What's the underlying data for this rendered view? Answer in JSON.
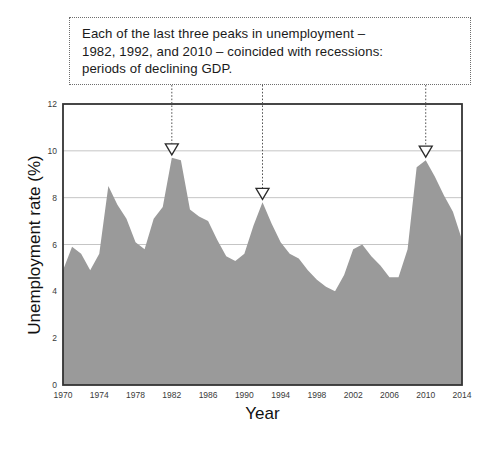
{
  "annotation": {
    "line1": "Each of the last three peaks in unemployment –",
    "line2": "1982, 1992, and 2010 – coincided with recessions:",
    "line3": "periods of declining GDP."
  },
  "caption": "",
  "colors": {
    "area_fill": "#9a9a9a",
    "axis": "#333333",
    "gridline": "#b6b6b6",
    "annotation_border": "#6e6e6e",
    "marker_stroke": "#2b2b2b",
    "dropline": "#555555",
    "text": "#1a1a1a"
  },
  "chart_data": {
    "type": "area",
    "title": "",
    "subtitle": "",
    "xlabel": "Year",
    "ylabel": "Unemployment rate (%)",
    "xlim": [
      1970,
      2014
    ],
    "ylim": [
      0,
      12
    ],
    "xticks": [
      1970,
      1974,
      1978,
      1982,
      1986,
      1990,
      1994,
      1998,
      2002,
      2006,
      2010,
      2014
    ],
    "yticks": [
      0,
      2,
      4,
      6,
      8,
      10,
      12
    ],
    "xtick_labels": [
      "1970",
      "1974",
      "1978",
      "1982",
      "1986",
      "1990",
      "1994",
      "1998",
      "2002",
      "2006",
      "2010",
      "2014"
    ],
    "ytick_labels": [
      "0",
      "2",
      "4",
      "6",
      "8",
      "10",
      "12"
    ],
    "grid": "horizontal-major",
    "gridline_values": [
      6,
      8,
      10
    ],
    "legend": "none",
    "x": [
      1970,
      1971,
      1972,
      1973,
      1974,
      1975,
      1976,
      1977,
      1978,
      1979,
      1980,
      1981,
      1982,
      1983,
      1984,
      1985,
      1986,
      1987,
      1988,
      1989,
      1990,
      1991,
      1992,
      1993,
      1994,
      1995,
      1996,
      1997,
      1998,
      1999,
      2000,
      2001,
      2002,
      2003,
      2004,
      2005,
      2006,
      2007,
      2008,
      2009,
      2010,
      2011,
      2012,
      2013,
      2014
    ],
    "values": [
      4.9,
      5.9,
      5.6,
      4.9,
      5.6,
      8.5,
      7.7,
      7.1,
      6.1,
      5.8,
      7.1,
      7.6,
      9.7,
      9.6,
      7.5,
      7.2,
      7.0,
      6.2,
      5.5,
      5.3,
      5.6,
      6.8,
      7.8,
      6.9,
      6.1,
      5.6,
      5.4,
      4.9,
      4.5,
      4.2,
      4.0,
      4.7,
      5.8,
      6.0,
      5.5,
      5.1,
      4.6,
      4.6,
      5.8,
      9.3,
      9.6,
      8.9,
      8.1,
      7.4,
      6.2
    ],
    "series": [
      {
        "name": "Unemployment rate",
        "values": [
          4.9,
          5.9,
          5.6,
          4.9,
          5.6,
          8.5,
          7.7,
          7.1,
          6.1,
          5.8,
          7.1,
          7.6,
          9.7,
          9.6,
          7.5,
          7.2,
          7.0,
          6.2,
          5.5,
          5.3,
          5.6,
          6.8,
          7.8,
          6.9,
          6.1,
          5.6,
          5.4,
          4.9,
          4.5,
          4.2,
          4.0,
          4.7,
          5.8,
          6.0,
          5.5,
          5.1,
          4.6,
          4.6,
          5.8,
          9.3,
          9.6,
          8.9,
          8.1,
          7.4,
          6.2
        ]
      }
    ],
    "annotations": [
      {
        "name": "peak-1982",
        "x": 1982,
        "y": 9.7,
        "marker": "down-triangle-open",
        "dropline": true
      },
      {
        "name": "peak-1992",
        "x": 1992,
        "y": 7.8,
        "marker": "down-triangle-open",
        "dropline": true
      },
      {
        "name": "peak-2010",
        "x": 2010,
        "y": 9.6,
        "marker": "down-triangle-open",
        "dropline": true
      }
    ]
  }
}
